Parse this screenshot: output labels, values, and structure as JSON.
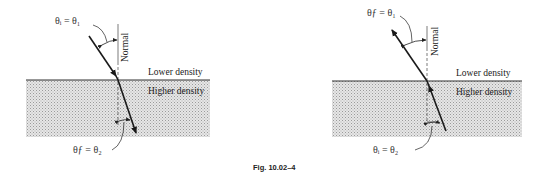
{
  "figure": {
    "caption": "Fig. 10.02–4"
  },
  "left_panel": {
    "incident_label": "θᵢ = θ₁",
    "refracted_label": "θƒ = θ₂",
    "normal_label": "Normal",
    "upper_medium": "Lower density",
    "lower_medium": "Higher density",
    "ray_direction": "downward-into-higher-density"
  },
  "right_panel": {
    "incident_label": "θᵢ = θ₂",
    "refracted_label": "θƒ = θ₁",
    "normal_label": "Normal",
    "upper_medium": "Lower density",
    "lower_medium": "Higher density",
    "ray_direction": "upward-into-lower-density"
  },
  "colors": {
    "ray": "#1a1a1a",
    "interface": "#333333",
    "dense_fill": "#d9d9d9"
  }
}
